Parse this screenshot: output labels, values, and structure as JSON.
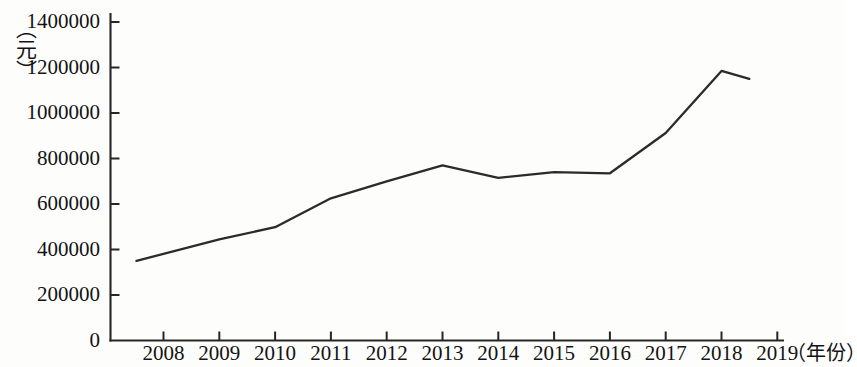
{
  "chart_data": {
    "type": "line",
    "title": "",
    "xlabel": "（年份）",
    "ylabel": "（元）",
    "categories": [
      "2008",
      "2009",
      "2010",
      "2011",
      "2012",
      "2013",
      "2014",
      "2015",
      "2016",
      "2017",
      "2018",
      "2019"
    ],
    "values": [
      350000,
      445000,
      498000,
      625000,
      700000,
      770000,
      715000,
      740000,
      735000,
      912000,
      1185000,
      1150000
    ],
    "series": [
      {
        "name": "",
        "values": [
          350000,
          445000,
          498000,
          625000,
          700000,
          770000,
          715000,
          740000,
          735000,
          912000,
          1185000,
          1150000
        ]
      }
    ],
    "ylim": [
      0,
      1400000
    ],
    "yticks": [
      0,
      200000,
      400000,
      600000,
      800000,
      1000000,
      1200000,
      1400000
    ],
    "ytick_labels": [
      "0",
      "200000",
      "400000",
      "600000",
      "800000",
      "1000000",
      "1200000",
      "1400000"
    ],
    "xtick_labels": [
      "2008",
      "2009",
      "2010",
      "2011",
      "2012",
      "2013",
      "2014",
      "2015",
      "2016",
      "2017",
      "2018",
      "2019"
    ],
    "grid": false,
    "legend": "none",
    "line_color": "#2b2b2b",
    "axis_color": "#262626"
  }
}
